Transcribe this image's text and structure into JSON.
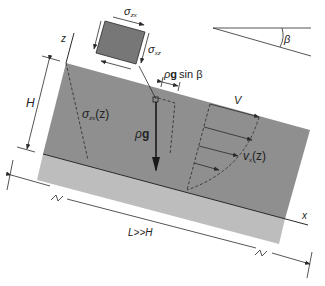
{
  "diagram": {
    "colors": {
      "slab": "#8e8e8e",
      "bed": "#b9b9b9",
      "stroke": "#2a2a2a",
      "element": "#7a7a7a"
    },
    "labels": {
      "z_axis": "z",
      "x_axis": "x",
      "thickness": "H",
      "length": "L>>H",
      "angle": "β",
      "shear_stress_profile": "σzx(z)",
      "shear_stress_profile_sym": "σ",
      "shear_stress_profile_sub": "zx",
      "shear_stress_profile_arg": "(z)",
      "velocity_profile_sym": "v",
      "velocity_profile_sub": "x",
      "velocity_profile_arg": "(z)",
      "surface_velocity": "V",
      "gravity_rho": "ρ",
      "gravity_g": "g",
      "gravity_component_rho": "ρ",
      "gravity_component_g": "g",
      "gravity_component_rest": "sin β",
      "element_top_sym": "σ",
      "element_top_sub": "zx",
      "element_side_sym": "σ",
      "element_side_sub": "xz"
    },
    "break_marks": [
      "≈",
      "≈"
    ]
  }
}
